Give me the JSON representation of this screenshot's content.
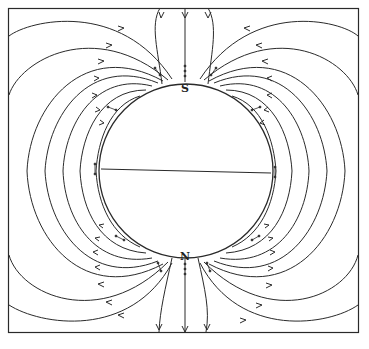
{
  "figure": {
    "pole_labels": {
      "top": "S",
      "bottom": "N"
    },
    "colors": {
      "ink": "#2a2a2a",
      "paper": "#ffffff"
    },
    "frame": {
      "x": 8,
      "y": 8,
      "width": 350,
      "height": 324
    },
    "sphere": {
      "cx": 186,
      "cy": 171,
      "r": 87
    },
    "equator": {
      "x1": 101,
      "y1": 169,
      "x2": 271,
      "y2": 173
    },
    "field_line_count_per_side": 8,
    "vertical_lines_top": 3,
    "vertical_lines_bottom": 3
  }
}
